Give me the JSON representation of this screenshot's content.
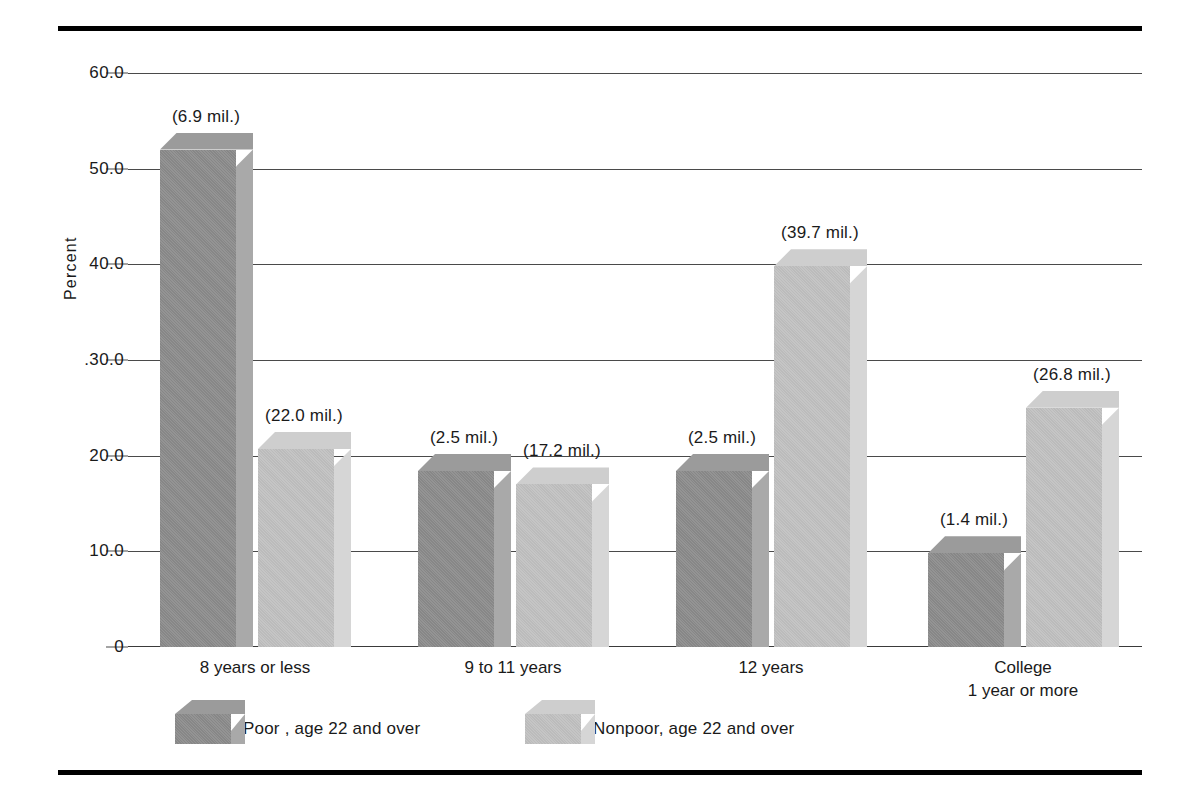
{
  "chart_data": {
    "type": "bar",
    "title": "",
    "xlabel": "",
    "ylabel": "Percent",
    "ylim": [
      0,
      60
    ],
    "yticks": [
      "0",
      "10.0",
      "20.0",
      "30.0",
      "40.0",
      "50.0",
      "60.0"
    ],
    "ytick_values": [
      0,
      10,
      20,
      30,
      40,
      50,
      60
    ],
    "grid": true,
    "legend_position": "bottom",
    "categories": [
      "8 years or less",
      "9 to 11 years",
      "12 years",
      "College\n1 year  or more"
    ],
    "category_lines": [
      [
        "8 years or less"
      ],
      [
        "9 to 11 years"
      ],
      [
        "12 years"
      ],
      [
        "College",
        "1 year  or more"
      ]
    ],
    "series": [
      {
        "name": "Poor , age 22 and over",
        "color": "#8e8e8e",
        "values": [
          52.0,
          18.4,
          18.4,
          9.8
        ],
        "point_labels": [
          "(6.9 mil.)",
          "(2.5 mil.)",
          "(2.5 mil.)",
          "(1.4 mil.)"
        ]
      },
      {
        "name": "Nonpoor, age 22 and over",
        "color": "#c3c3c3",
        "values": [
          20.7,
          17.0,
          39.8,
          25.0
        ],
        "point_labels": [
          "(22.0 mil.)",
          "(17.2 mil.)",
          "(39.7 mil.)",
          "(26.8 mil.)"
        ]
      }
    ]
  },
  "axis": {
    "y_label": "Percent",
    "ticks": [
      {
        "label": "60.0",
        "value": 60
      },
      {
        "label": "50.0",
        "value": 50
      },
      {
        "label": "40.0",
        "value": 40
      },
      {
        "label": ".30.0",
        "value": 30
      },
      {
        "label": "20.0",
        "value": 20
      },
      {
        "label": "10.0",
        "value": 10
      },
      {
        "label": "0",
        "value": 0
      }
    ]
  },
  "legend": [
    {
      "label": "Poor , age 22 and over",
      "series": "poor"
    },
    {
      "label": "Nonpoor, age 22 and over",
      "series": "nonpoor"
    }
  ]
}
